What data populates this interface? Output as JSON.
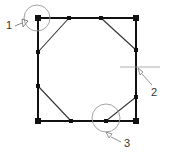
{
  "diagram": {
    "colors": {
      "outline": "#111111",
      "chamfer": "#333333",
      "callout": "#9a9a9a",
      "label": "#333333"
    },
    "square": {
      "x1": 38,
      "y1": 18,
      "x2": 136,
      "y2": 121
    },
    "corner_markers": [
      {
        "x": 38,
        "y": 18
      },
      {
        "x": 136,
        "y": 18
      },
      {
        "x": 136,
        "y": 121
      },
      {
        "x": 38,
        "y": 121
      }
    ],
    "edge_points": [
      {
        "x": 69,
        "y": 18
      },
      {
        "x": 101,
        "y": 18
      },
      {
        "x": 136,
        "y": 50
      },
      {
        "x": 136,
        "y": 97
      },
      {
        "x": 106,
        "y": 121
      },
      {
        "x": 71,
        "y": 121
      },
      {
        "x": 38,
        "y": 86
      },
      {
        "x": 38,
        "y": 52
      }
    ],
    "chamfers": [
      {
        "from": [
          69,
          18
        ],
        "to": [
          38,
          52
        ]
      },
      {
        "from": [
          101,
          18
        ],
        "to": [
          136,
          50
        ]
      },
      {
        "from": [
          136,
          97
        ],
        "to": [
          106,
          121
        ]
      },
      {
        "from": [
          71,
          121
        ],
        "to": [
          38,
          86
        ]
      }
    ],
    "callouts": [
      {
        "label": "1",
        "type": "circle",
        "cx": 37,
        "cy": 18,
        "r": 13,
        "text_x": 6,
        "text_y": 28
      },
      {
        "label": "2",
        "type": "crosshair",
        "cx": 136,
        "cy": 67,
        "text_x": 151,
        "text_y": 95
      },
      {
        "label": "3",
        "type": "circle",
        "cx": 106,
        "cy": 118,
        "r": 14,
        "text_x": 124,
        "text_y": 146
      }
    ]
  }
}
